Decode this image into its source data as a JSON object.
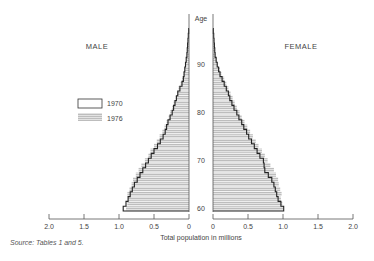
{
  "chart_data": {
    "type": "bar",
    "subtype": "population-pyramid",
    "title": "",
    "xlabel": "Total population in millions",
    "ylabel": "Age",
    "side_labels": {
      "left": "MALE",
      "right": "FEMALE"
    },
    "legend": [
      {
        "name": "1970",
        "style": "outline"
      },
      {
        "name": "1976",
        "style": "shaded"
      }
    ],
    "legend_position": "left",
    "x_ticks_left": [
      "2.0",
      "1.5",
      "1.0",
      "0.5",
      "0"
    ],
    "x_ticks_right": [
      "0",
      "0.5",
      "1.0",
      "1.5",
      "2.0"
    ],
    "x_tick_values": [
      0,
      0.5,
      1.0,
      1.5,
      2.0
    ],
    "xlim": [
      0,
      2.0
    ],
    "age_ticks": [
      "60",
      "70",
      "80",
      "90"
    ],
    "age_tick_values": [
      60,
      70,
      80,
      90
    ],
    "ylim": [
      60,
      98
    ],
    "ages": [
      60,
      61,
      62,
      63,
      64,
      65,
      66,
      67,
      68,
      69,
      70,
      71,
      72,
      73,
      74,
      75,
      76,
      77,
      78,
      79,
      80,
      81,
      82,
      83,
      84,
      85,
      86,
      87,
      88,
      89,
      90,
      91,
      92,
      93,
      94,
      95,
      96,
      97
    ],
    "series": [
      {
        "name": "Male 1970",
        "values": [
          0.94,
          0.9,
          0.87,
          0.84,
          0.81,
          0.78,
          0.74,
          0.7,
          0.66,
          0.62,
          0.58,
          0.54,
          0.5,
          0.45,
          0.41,
          0.37,
          0.34,
          0.32,
          0.3,
          0.27,
          0.24,
          0.22,
          0.2,
          0.18,
          0.16,
          0.13,
          0.1,
          0.08,
          0.07,
          0.06,
          0.05,
          0.04,
          0.03,
          0.025,
          0.02,
          0.015,
          0.01,
          0.005
        ]
      },
      {
        "name": "Male 1976",
        "values": [
          0.9,
          0.88,
          0.87,
          0.88,
          0.85,
          0.82,
          0.8,
          0.76,
          0.72,
          0.68,
          0.63,
          0.58,
          0.55,
          0.5,
          0.46,
          0.42,
          0.38,
          0.35,
          0.32,
          0.29,
          0.27,
          0.24,
          0.22,
          0.19,
          0.17,
          0.15,
          0.12,
          0.1,
          0.08,
          0.06,
          0.05,
          0.04,
          0.03,
          0.025,
          0.02,
          0.015,
          0.01,
          0.005
        ]
      },
      {
        "name": "Female 1970",
        "values": [
          1.01,
          0.97,
          0.93,
          0.91,
          0.89,
          0.87,
          0.84,
          0.79,
          0.74,
          0.73,
          0.72,
          0.67,
          0.63,
          0.59,
          0.55,
          0.51,
          0.48,
          0.44,
          0.41,
          0.37,
          0.34,
          0.3,
          0.27,
          0.24,
          0.22,
          0.19,
          0.16,
          0.13,
          0.1,
          0.08,
          0.06,
          0.045,
          0.03,
          0.025,
          0.02,
          0.015,
          0.01,
          0.005
        ]
      },
      {
        "name": "Female 1976",
        "values": [
          1.0,
          0.99,
          0.97,
          0.98,
          0.96,
          0.94,
          0.93,
          0.9,
          0.87,
          0.82,
          0.78,
          0.74,
          0.7,
          0.65,
          0.61,
          0.57,
          0.53,
          0.49,
          0.45,
          0.41,
          0.38,
          0.34,
          0.31,
          0.28,
          0.25,
          0.22,
          0.19,
          0.16,
          0.12,
          0.1,
          0.07,
          0.05,
          0.04,
          0.03,
          0.02,
          0.015,
          0.01,
          0.005
        ]
      }
    ]
  },
  "footer": {
    "source": "Source:  Tables 1 and 5."
  }
}
